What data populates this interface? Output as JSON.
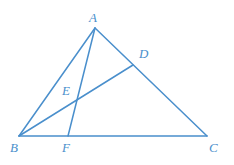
{
  "figure": {
    "background_color": "#ffffff",
    "stroke_color": "#4a8fcc",
    "label_color": "#4a8fcc",
    "stroke_width": 1.5,
    "width": 234,
    "height": 165
  },
  "chart_data": {
    "type": "diagram",
    "points": [
      {
        "id": "A",
        "label": "A",
        "x": 95,
        "y": 28,
        "label_x": 89,
        "label_y": 22,
        "role": "apex-vertex"
      },
      {
        "id": "B",
        "label": "B",
        "x": 19,
        "y": 136,
        "label_x": 10,
        "label_y": 152,
        "role": "base-left-vertex"
      },
      {
        "id": "C",
        "label": "C",
        "x": 207,
        "y": 136,
        "label_x": 209,
        "label_y": 152,
        "role": "base-right-vertex"
      },
      {
        "id": "D",
        "label": "D",
        "x": 133,
        "y": 65,
        "label_x": 139,
        "label_y": 58,
        "role": "point-on-AC"
      },
      {
        "id": "E",
        "label": "E",
        "x": 73,
        "y": 99,
        "label_x": 62,
        "label_y": 95,
        "role": "cevian-intersection"
      },
      {
        "id": "F",
        "label": "F",
        "x": 68,
        "y": 136,
        "label_x": 62,
        "label_y": 152,
        "role": "point-on-BC"
      }
    ],
    "segments": [
      {
        "id": "AB",
        "from": "A",
        "to": "B",
        "name": "side-ab"
      },
      {
        "id": "AC",
        "from": "A",
        "to": "C",
        "name": "side-ac"
      },
      {
        "id": "BC",
        "from": "B",
        "to": "C",
        "name": "side-bc"
      },
      {
        "id": "AF",
        "from": "A",
        "to": "F",
        "name": "cevian-af"
      },
      {
        "id": "BD",
        "from": "B",
        "to": "D",
        "name": "cevian-bd"
      }
    ],
    "labels": [
      "A",
      "B",
      "C",
      "D",
      "E",
      "F"
    ]
  }
}
